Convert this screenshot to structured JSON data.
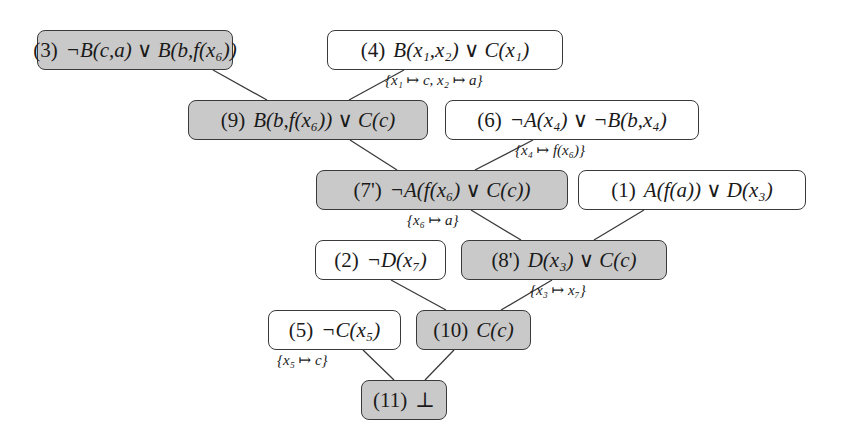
{
  "diagram": {
    "type": "resolution-refutation-tree",
    "colors": {
      "derived_fill": "#c9c9c9",
      "input_fill": "#ffffff",
      "border": "#3a3a3a",
      "edge": "#3a3a3a"
    },
    "nodes": [
      {
        "key": "n3",
        "id": "(3)",
        "formula": "¬B(c,a) ∨ B(b,f(x₆))",
        "derived": true
      },
      {
        "key": "n4",
        "id": "(4)",
        "formula": "B(x₁,x₂) ∨ C(x₁)",
        "derived": false
      },
      {
        "key": "n9",
        "id": "(9)",
        "formula": "B(b,f(x₆)) ∨ C(c)",
        "derived": true
      },
      {
        "key": "n6",
        "id": "(6)",
        "formula": "¬A(x₄) ∨ ¬B(b,x₄)",
        "derived": false
      },
      {
        "key": "n7",
        "id": "(7')",
        "formula": "¬A(f(x₆) ∨ C(c))",
        "derived": true
      },
      {
        "key": "n1",
        "id": "(1)",
        "formula": "A(f(a)) ∨ D(x₃)",
        "derived": false
      },
      {
        "key": "n2",
        "id": "(2)",
        "formula": "¬D(x₇)",
        "derived": false
      },
      {
        "key": "n8",
        "id": "(8')",
        "formula": "D(x₃) ∨ C(c)",
        "derived": true
      },
      {
        "key": "n5",
        "id": "(5)",
        "formula": "¬C(x₅)",
        "derived": false
      },
      {
        "key": "n10",
        "id": "(10)",
        "formula": "C(c)",
        "derived": true
      },
      {
        "key": "n11",
        "id": "(11)",
        "formula": "⊥",
        "derived": true
      }
    ],
    "edges": [
      {
        "from": "n3",
        "to": "n9"
      },
      {
        "from": "n4",
        "to": "n9",
        "substitution": "{x₁ ↦ c, x₂ ↦ a}"
      },
      {
        "from": "n9",
        "to": "n7"
      },
      {
        "from": "n6",
        "to": "n7",
        "substitution": "{x₄ ↦ f(x₆)}"
      },
      {
        "from": "n7",
        "to": "n8",
        "substitution": "{x₆ ↦ a}"
      },
      {
        "from": "n1",
        "to": "n8"
      },
      {
        "from": "n2",
        "to": "n10"
      },
      {
        "from": "n8",
        "to": "n10",
        "substitution": "{x₃ ↦ x₇}"
      },
      {
        "from": "n5",
        "to": "n11",
        "substitution": "{x₅ ↦ c}"
      },
      {
        "from": "n10",
        "to": "n11"
      }
    ]
  }
}
